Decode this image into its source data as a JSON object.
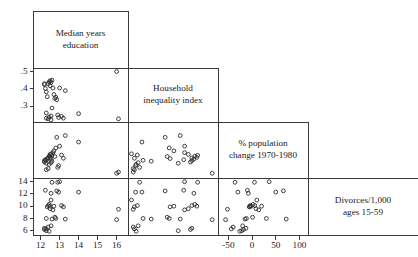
{
  "chart_data": {
    "type": "scatter",
    "title": "",
    "subtitle": "",
    "layout": "scatterplot-matrix-lower-triangle",
    "grid": false,
    "legend": "none",
    "variables": [
      {
        "key": "education",
        "diag_label_line1": "Median years",
        "diag_label_line2": "education",
        "axis_ticks": [
          "12",
          "13",
          "14",
          "15",
          "16"
        ],
        "tick_values": [
          12,
          13,
          14,
          15,
          16
        ],
        "range": [
          11.6,
          16.6
        ]
      },
      {
        "key": "inequality",
        "diag_label_line1": "Household",
        "diag_label_line2": "inequality index",
        "axis_ticks": [
          ".5",
          ".4",
          ".3"
        ],
        "tick_values": [
          0.5,
          0.4,
          0.3
        ],
        "range": [
          0.21,
          0.52
        ]
      },
      {
        "key": "popchange",
        "diag_label_line1": "% population",
        "diag_label_line2": "change 1970-1980",
        "axis_ticks": [
          "-50",
          "0",
          "50",
          "100"
        ],
        "tick_values": [
          -50,
          0,
          50,
          100
        ],
        "range": [
          -72,
          118
        ]
      },
      {
        "key": "divorces",
        "diag_label_line1": "Divorces/1,000",
        "diag_label_line2": "ages 15-59",
        "axis_ticks": [
          "14",
          "12",
          "10",
          "8",
          "6"
        ],
        "tick_values": [
          14,
          12,
          10,
          8,
          6
        ],
        "range": [
          5.3,
          14.6
        ]
      }
    ],
    "points": [
      {
        "education": 12.2,
        "inequality": 0.425,
        "popchange": -18,
        "divorces": 6.2
      },
      {
        "education": 12.2,
        "inequality": 0.43,
        "popchange": -13,
        "divorces": 6.4
      },
      {
        "education": 12.25,
        "inequality": 0.402,
        "popchange": -10,
        "divorces": 12.6
      },
      {
        "education": 12.3,
        "inequality": 0.383,
        "popchange": -22,
        "divorces": 6.0
      },
      {
        "education": 12.35,
        "inequality": 0.355,
        "popchange": -6,
        "divorces": 9.9
      },
      {
        "education": 12.4,
        "inequality": 0.43,
        "popchange": -4,
        "divorces": 10.1
      },
      {
        "education": 12.45,
        "inequality": 0.44,
        "popchange": 2,
        "divorces": 10.3
      },
      {
        "education": 12.5,
        "inequality": 0.447,
        "popchange": -2,
        "divorces": 10.0
      },
      {
        "education": 12.5,
        "inequality": 0.418,
        "popchange": 8,
        "divorces": 9.6
      },
      {
        "education": 12.55,
        "inequality": 0.437,
        "popchange": -8,
        "divorces": 12.1
      },
      {
        "education": 12.6,
        "inequality": 0.45,
        "popchange": 5,
        "divorces": 13.9
      },
      {
        "education": 12.6,
        "inequality": 0.29,
        "popchange": -15,
        "divorces": 7.9
      },
      {
        "education": 12.65,
        "inequality": 0.405,
        "popchange": 14,
        "divorces": 9.4
      },
      {
        "education": 12.7,
        "inequality": 0.368,
        "popchange": 20,
        "divorces": 10.0
      },
      {
        "education": 12.75,
        "inequality": 0.345,
        "popchange": 1,
        "divorces": 8.2
      },
      {
        "education": 12.8,
        "inequality": 0.352,
        "popchange": 30,
        "divorces": 8.0
      },
      {
        "education": 12.85,
        "inequality": 0.338,
        "popchange": 66,
        "divorces": 12.5
      },
      {
        "education": 12.9,
        "inequality": 0.25,
        "popchange": -36,
        "divorces": 13.9
      },
      {
        "education": 12.95,
        "inequality": 0.236,
        "popchange": -30,
        "divorces": 12.3
      },
      {
        "education": 13.0,
        "inequality": 0.405,
        "popchange": 36,
        "divorces": 14.0
      },
      {
        "education": 13.1,
        "inequality": 0.242,
        "popchange": 6,
        "divorces": 10.1
      },
      {
        "education": 13.2,
        "inequality": 0.232,
        "popchange": -5,
        "divorces": 9.9
      },
      {
        "education": 13.3,
        "inequality": 0.39,
        "popchange": 72,
        "divorces": 7.9
      },
      {
        "education": 14.0,
        "inequality": 0.258,
        "popchange": 50,
        "divorces": 12.3
      },
      {
        "education": 16.0,
        "inequality": 0.5,
        "popchange": -56,
        "divorces": 7.8
      },
      {
        "education": 16.1,
        "inequality": 0.228,
        "popchange": -52,
        "divorces": 9.5
      },
      {
        "education": 12.3,
        "inequality": 0.232,
        "popchange": -44,
        "divorces": 6.3
      },
      {
        "education": 12.4,
        "inequality": 0.228,
        "popchange": -40,
        "divorces": 6.6
      },
      {
        "education": 12.45,
        "inequality": 0.238,
        "popchange": -26,
        "divorces": 5.9
      },
      {
        "education": 12.55,
        "inequality": 0.245,
        "popchange": -20,
        "divorces": 6.8
      },
      {
        "education": 12.3,
        "inequality": 0.262,
        "popchange": -12,
        "divorces": 8.0
      },
      {
        "education": 12.55,
        "inequality": 0.222,
        "popchange": 10,
        "divorces": 11.0
      }
    ],
    "xlabel": "",
    "ylabel": ""
  },
  "figure": {
    "caption": ""
  }
}
